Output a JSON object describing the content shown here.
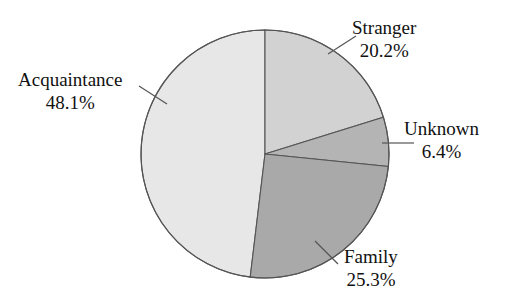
{
  "chart_data": {
    "type": "pie",
    "title": "",
    "xlabel": "",
    "ylabel": "",
    "legend_position": "none",
    "grid": false,
    "label_format": "name + percent",
    "start_angle_deg": 0,
    "direction": "clockwise",
    "categories": [
      "Stranger",
      "Unknown",
      "Family",
      "Acquaintance"
    ],
    "values": [
      20.2,
      6.4,
      25.3,
      48.1
    ],
    "slices": [
      {
        "name": "Stranger",
        "percent": 20.2,
        "percent_label": "20.2%",
        "color": "#d2d2d2",
        "start_deg": 0.0,
        "end_deg": 72.72
      },
      {
        "name": "Unknown",
        "percent": 6.4,
        "percent_label": "6.4%",
        "color": "#b4b4b4",
        "start_deg": 72.72,
        "end_deg": 95.76
      },
      {
        "name": "Family",
        "percent": 25.3,
        "percent_label": "25.3%",
        "color": "#a9a9a9",
        "start_deg": 95.76,
        "end_deg": 186.84
      },
      {
        "name": "Acquaintance",
        "percent": 48.1,
        "percent_label": "48.1%",
        "color": "#e7e7e7",
        "start_deg": 186.84,
        "end_deg": 360.0
      }
    ]
  },
  "labels": {
    "stranger": {
      "name": "Stranger",
      "value": "20.2%"
    },
    "acquaintance": {
      "name": "Acquaintance",
      "value": "48.1%"
    },
    "unknown": {
      "name": "Unknown",
      "value": "6.4%"
    },
    "family": {
      "name": "Family",
      "value": "25.3%"
    }
  },
  "colors": {
    "stranger": "#d2d2d2",
    "unknown": "#b4b4b4",
    "family": "#a9a9a9",
    "acquaintance": "#e7e7e7",
    "outline": "#555555",
    "leader": "#555555",
    "background": "#ffffff",
    "text": "#111111"
  }
}
